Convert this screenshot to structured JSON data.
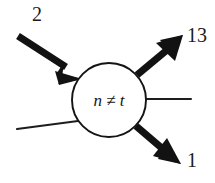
{
  "diagram": {
    "type": "flow-node",
    "background_color": "#ffffff",
    "ink_color": "#121212",
    "node": {
      "shape": "circle",
      "label": "n ≠ t",
      "center_x": 109,
      "center_y": 100,
      "radius": 37
    },
    "edges": [
      {
        "id": "edge-in-upper-left",
        "direction": "incoming",
        "style": "thick-arrow",
        "label": "2",
        "label_x": 37,
        "label_y": 20,
        "from_x": 18,
        "from_y": 36,
        "to_x": 81,
        "to_y": 78
      },
      {
        "id": "edge-in-lower-left",
        "direction": "incoming",
        "style": "thin-line",
        "label": "",
        "from_x": 17,
        "from_y": 129,
        "to_x": 76,
        "to_y": 122
      },
      {
        "id": "edge-out-upper-right",
        "direction": "outgoing",
        "style": "thick-arrow",
        "label": "13",
        "label_x": 186,
        "label_y": 42,
        "from_x": 138,
        "from_y": 74,
        "to_x": 182,
        "to_y": 36
      },
      {
        "id": "edge-out-right",
        "direction": "outgoing",
        "style": "thin-line",
        "label": "",
        "from_x": 145,
        "from_y": 99,
        "to_x": 191,
        "to_y": 99
      },
      {
        "id": "edge-out-lower-right",
        "direction": "outgoing",
        "style": "thick-arrow",
        "label": "1",
        "label_x": 190,
        "label_y": 167,
        "from_x": 136,
        "from_y": 126,
        "to_x": 179,
        "to_y": 164
      }
    ]
  }
}
